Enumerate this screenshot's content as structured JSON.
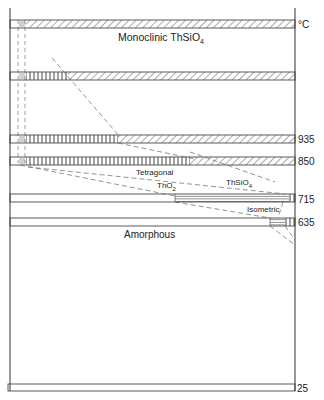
{
  "diagram": {
    "type": "phase-stability",
    "axis_unit": "°C",
    "temperature_ticks": [
      {
        "label": "935",
        "y": 139
      },
      {
        "label": "850",
        "y": 161
      },
      {
        "label": "715",
        "y": 199
      },
      {
        "label": "635",
        "y": 222
      },
      {
        "label": "25",
        "y": 388
      }
    ],
    "regions": {
      "monoclinic": "Monoclinic  ThSiO",
      "monoclinic_sub": "4",
      "tetragonal": "Tetragonal",
      "tho2": "ThO",
      "tho2_sub": "2",
      "thsio4": "ThSiO",
      "thsio4_sub": "4",
      "isometric": "Isometric",
      "amorphous": "Amorphous"
    },
    "colors": {
      "line": "#333333",
      "dash": "#666666",
      "hatch": "#555555"
    }
  }
}
